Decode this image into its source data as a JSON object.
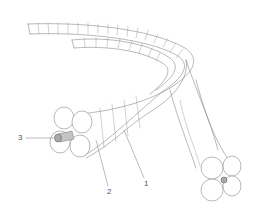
{
  "diagram": {
    "type": "technical-illustration",
    "colors": {
      "line": "#8a8a8a",
      "fill": "#ffffff",
      "core": "#a8a8a8",
      "label": "#555555"
    },
    "labels": [
      {
        "id": "1",
        "text": "1"
      },
      {
        "id": "2",
        "text": "2"
      },
      {
        "id": "3",
        "text": "3"
      }
    ]
  }
}
